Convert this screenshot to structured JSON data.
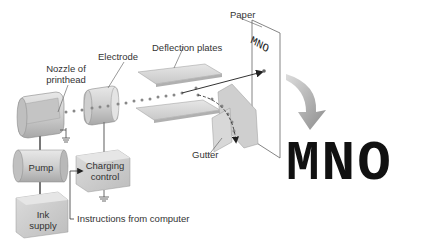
{
  "diagram": {
    "type": "inkjet-printer-schematic",
    "labels": {
      "paper": "Paper",
      "electrode": "Electrode",
      "deflection_plates": "Deflection plates",
      "nozzle_line1": "Nozzle of",
      "nozzle_line2": "printhead",
      "gutter": "Gutter",
      "pump": "Pump",
      "charging_line1": "Charging",
      "charging_line2": "control",
      "ink_line1": "Ink",
      "ink_line2": "supply",
      "instructions": "Instructions from computer"
    },
    "printed_text_on_paper": "MNO",
    "printed_output": "MNO",
    "colors": {
      "component_fill": "#d9d9d9",
      "component_shade": "#b8b8b8",
      "line": "#555555",
      "arrow": "#9a9a9a",
      "text": "#333333",
      "output_text": "#111111"
    }
  }
}
